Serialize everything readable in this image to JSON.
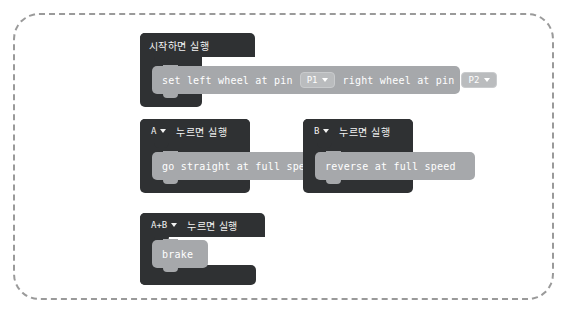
{
  "workspace": {
    "name": "makecode-block-workspace",
    "border_style": "dashed",
    "border_color": "#9a9a9a",
    "background_color": "#ffffff"
  },
  "colors": {
    "event_block": "#2f3133",
    "statement_block": "#a6a8ab",
    "field_background": "#babcbe",
    "text": "#ffffff"
  },
  "blocks": [
    {
      "id": "on-start",
      "header_label": "시작하면 실행",
      "has_dropdown": false,
      "statements": [
        {
          "id": "set-wheels",
          "parts": [
            {
              "type": "text",
              "value": "set left wheel at pin"
            },
            {
              "type": "field",
              "value": "P1",
              "icon": "chevron-down-icon"
            },
            {
              "type": "text",
              "value": "right wheel at pin"
            },
            {
              "type": "field",
              "value": "P2",
              "icon": "chevron-down-icon"
            }
          ]
        }
      ]
    },
    {
      "id": "on-button-a",
      "dropdown_value": "A",
      "dropdown_icon": "chevron-down-icon",
      "header_label": "누르면 실행",
      "has_dropdown": true,
      "statements": [
        {
          "id": "go-straight",
          "parts": [
            {
              "type": "text",
              "value": "go straight at full speed"
            }
          ]
        }
      ]
    },
    {
      "id": "on-button-b",
      "dropdown_value": "B",
      "dropdown_icon": "chevron-down-icon",
      "header_label": "누르면 실행",
      "has_dropdown": true,
      "statements": [
        {
          "id": "reverse",
          "parts": [
            {
              "type": "text",
              "value": "reverse at full speed"
            }
          ]
        }
      ]
    },
    {
      "id": "on-button-ab",
      "dropdown_value": "A+B",
      "dropdown_icon": "chevron-down-icon",
      "header_label": "누르면 실행",
      "has_dropdown": true,
      "statements": [
        {
          "id": "brake",
          "parts": [
            {
              "type": "text",
              "value": "brake"
            }
          ]
        }
      ]
    }
  ]
}
